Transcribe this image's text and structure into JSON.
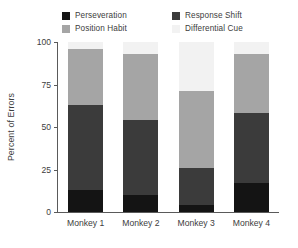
{
  "chart_data": {
    "type": "bar",
    "subtype": "stacked-bar",
    "title": "",
    "xlabel": "",
    "ylabel": "Percent of Errors",
    "ylim": [
      0,
      100
    ],
    "yticks": [
      0,
      25,
      50,
      75,
      100
    ],
    "ytick_labels": [
      "0",
      "25",
      "50",
      "75",
      "100"
    ],
    "grid": false,
    "legend_position": "top",
    "categories": [
      "Monkey 1",
      "Monkey 2",
      "Monkey 3",
      "Monkey 4"
    ],
    "stack_order_bottom_to_top": [
      "Perseveration",
      "Response Shift",
      "Position Habit",
      "Differential Cue"
    ],
    "series": [
      {
        "name": "Perseveration",
        "color": "#141414",
        "values": [
          13,
          10,
          4,
          17
        ]
      },
      {
        "name": "Response Shift",
        "color": "#3b3b3b",
        "values": [
          50,
          44,
          22,
          41
        ]
      },
      {
        "name": "Position Habit",
        "color": "#a5a5a5",
        "values": [
          33,
          39,
          45,
          35
        ]
      },
      {
        "name": "Differential Cue",
        "color": "#f2f2f2",
        "values": [
          4,
          7,
          29,
          7
        ]
      }
    ],
    "cumulative_tops": [
      [
        13,
        63,
        96,
        100
      ],
      [
        10,
        54,
        93,
        100
      ],
      [
        4,
        26,
        71,
        100
      ],
      [
        17,
        58,
        93,
        100
      ]
    ]
  },
  "legend": {
    "items": [
      {
        "label": "Perseveration",
        "color": "#141414"
      },
      {
        "label": "Response Shift",
        "color": "#3b3b3b"
      },
      {
        "label": "Position Habit",
        "color": "#a5a5a5"
      },
      {
        "label": "Differential Cue",
        "color": "#f2f2f2"
      }
    ]
  },
  "axis": {
    "y_label": "Percent of Errors",
    "y_ticks": [
      "100",
      "75",
      "50",
      "25",
      "0"
    ],
    "x_ticks": [
      "Monkey 1",
      "Monkey 2",
      "Monkey 3",
      "Monkey 4"
    ]
  },
  "colors": {
    "background": "#ffffff",
    "axis": "#5a5a5a",
    "text": "#3d3d3d"
  }
}
